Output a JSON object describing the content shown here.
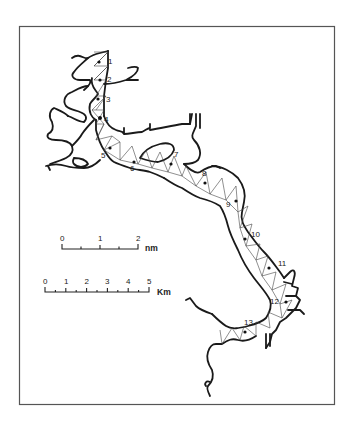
{
  "map": {
    "frame_color": "#555555",
    "line_color": "#1a1a1a",
    "stations": [
      {
        "label": "1",
        "dot": [
          99,
          62
        ],
        "text": [
          108,
          64
        ]
      },
      {
        "label": "2",
        "dot": [
          100,
          80
        ],
        "text": [
          107,
          82
        ]
      },
      {
        "label": "3",
        "dot": [
          98,
          99
        ],
        "text": [
          106,
          102
        ]
      },
      {
        "label": "4",
        "dot": [
          100,
          118
        ],
        "text": [
          104,
          122
        ]
      },
      {
        "label": "5",
        "dot": [
          110,
          148
        ],
        "text": [
          101,
          158
        ]
      },
      {
        "label": "6",
        "dot": [
          134,
          162
        ],
        "text": [
          130,
          171
        ]
      },
      {
        "label": "7",
        "dot": [
          171,
          164
        ],
        "text": [
          174,
          157
        ]
      },
      {
        "label": "8",
        "dot": [
          205,
          183
        ],
        "text": [
          202,
          176
        ]
      },
      {
        "label": "9",
        "dot": [
          236,
          201
        ],
        "text": [
          226,
          207
        ]
      },
      {
        "label": "10",
        "dot": [
          245,
          239
        ],
        "text": [
          251,
          237
        ]
      },
      {
        "label": "11",
        "dot": [
          269,
          268
        ],
        "text": [
          278,
          266
        ]
      },
      {
        "label": "12",
        "dot": [
          286,
          302
        ],
        "text": [
          270,
          304
        ]
      },
      {
        "label": "13",
        "dot": [
          245,
          332
        ],
        "text": [
          244,
          325
        ]
      }
    ]
  },
  "scale_bars": {
    "nautical": {
      "unit": "nm",
      "ticks": [
        "0",
        "1",
        "2"
      ]
    },
    "metric": {
      "unit": "Km",
      "ticks": [
        "0",
        "1",
        "2",
        "3",
        "4",
        "5"
      ]
    }
  }
}
